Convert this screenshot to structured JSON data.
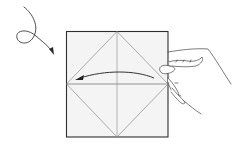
{
  "diagram": {
    "type": "origami-instruction-step",
    "colors": {
      "background": "#ffffff",
      "paper_fill": "#f4f4f4",
      "paper_border": "#333333",
      "crease_lines": "#8a8a8a",
      "arrow": "#333333",
      "hand_outline": "#444444"
    },
    "paper": {
      "x": 66,
      "y": 31,
      "width": 102,
      "height": 106
    },
    "symbols": [
      {
        "name": "turn-over-arrow",
        "meaning": "turn paper over"
      },
      {
        "name": "fold-arrow",
        "meaning": "fold right edge to left"
      },
      {
        "name": "hand",
        "meaning": "holding paper at right edge"
      }
    ]
  }
}
